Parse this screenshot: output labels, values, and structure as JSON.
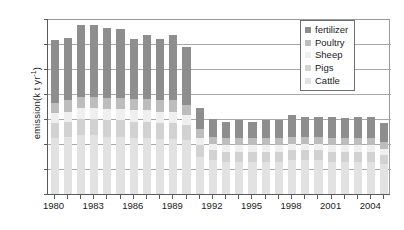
{
  "chart_data": {
    "type": "bar",
    "stacked": true,
    "title": "",
    "xlabel": "",
    "ylabel": "emission(k t yr",
    "ylabel_sup": "-1",
    "ylabel_tail": ")",
    "ylim": [
      0,
      140
    ],
    "ytick_values": [
      0,
      20,
      40,
      60,
      80,
      100,
      120,
      140
    ],
    "grid": true,
    "legend_position": "top-right",
    "categories": [
      "1980",
      "1981",
      "1982",
      "1983",
      "1984",
      "1985",
      "1986",
      "1987",
      "1988",
      "1989",
      "1990",
      "1991",
      "1992",
      "1993",
      "1994",
      "1995",
      "1996",
      "1997",
      "1998",
      "1999",
      "2000",
      "2001",
      "2002",
      "2003",
      "2004",
      "2005"
    ],
    "xtick_labels": [
      "1980",
      "1983",
      "1986",
      "1989",
      "1992",
      "1995",
      "1998",
      "2001",
      "2004"
    ],
    "series": [
      {
        "name": "Cattle",
        "color": "#e2e2e2",
        "values": [
          45,
          46,
          47,
          47,
          46,
          46,
          45,
          45,
          44,
          44,
          43,
          30,
          27,
          26,
          26,
          26,
          26,
          26,
          27,
          27,
          27,
          26,
          26,
          26,
          26,
          24
        ]
      },
      {
        "name": "Pigs",
        "color": "#d2d2d2",
        "values": [
          12,
          12,
          13,
          13,
          13,
          13,
          13,
          13,
          13,
          13,
          12,
          9,
          8,
          8,
          8,
          8,
          8,
          8,
          8,
          8,
          8,
          8,
          8,
          8,
          8,
          7
        ]
      },
      {
        "name": "Sheep",
        "color": "#efefef",
        "values": [
          8,
          8,
          9,
          9,
          9,
          9,
          9,
          9,
          9,
          9,
          8,
          6,
          5,
          5,
          5,
          5,
          5,
          5,
          5,
          5,
          5,
          5,
          5,
          5,
          5,
          5
        ]
      },
      {
        "name": "Poultry",
        "color": "#bdbdbd",
        "values": [
          8,
          9,
          9,
          9,
          9,
          9,
          9,
          9,
          9,
          9,
          8,
          7,
          6,
          6,
          6,
          6,
          6,
          6,
          6,
          6,
          6,
          6,
          6,
          6,
          6,
          6
        ]
      },
      {
        "name": "fertilizer",
        "color": "#8e8e8e",
        "values": [
          50,
          50,
          57,
          57,
          56,
          55,
          48,
          51,
          49,
          52,
          47,
          17,
          14,
          13,
          14,
          13,
          14,
          14,
          17,
          16,
          16,
          17,
          16,
          17,
          17,
          15
        ]
      }
    ],
    "bar_totals": [
      123,
      125,
      135,
      135,
      133,
      132,
      124,
      127,
      124,
      127,
      118,
      69,
      60,
      58,
      59,
      58,
      59,
      59,
      63,
      62,
      62,
      62,
      61,
      62,
      62,
      57
    ],
    "legend_entries": [
      "fertilizer",
      "Poultry",
      "Sheep",
      "Pigs",
      "Cattle"
    ]
  }
}
